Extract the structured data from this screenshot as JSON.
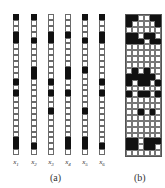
{
  "panel_a": {
    "caption": "(a)",
    "rows": 24,
    "columns": [
      {
        "label": "x",
        "subscript": "1",
        "left": 13,
        "on": [
          0,
          3,
          4,
          11,
          13,
          21,
          22
        ]
      },
      {
        "label": "x",
        "subscript": "2",
        "left": 31,
        "on": [
          0,
          4,
          9,
          10,
          22
        ]
      },
      {
        "label": "x",
        "subscript": "3",
        "left": 48,
        "on": [
          3,
          4,
          11,
          13,
          16
        ]
      },
      {
        "label": "x",
        "subscript": "4",
        "left": 65,
        "on": [
          3,
          9,
          10,
          13,
          21,
          22
        ]
      },
      {
        "label": "x",
        "subscript": "5",
        "left": 82,
        "on": [
          0,
          4,
          9,
          16,
          21,
          22
        ]
      },
      {
        "label": "x",
        "subscript": "6",
        "left": 99,
        "on": [
          0,
          3,
          4,
          11,
          13,
          22
        ]
      }
    ]
  },
  "panel_b": {
    "caption": "(b)",
    "cols": 6,
    "rows": 24,
    "on": [
      [
        0,
        0
      ],
      [
        0,
        1
      ],
      [
        0,
        4
      ],
      [
        0,
        5
      ],
      [
        1,
        0
      ],
      [
        1,
        5
      ],
      [
        3,
        0
      ],
      [
        3,
        1
      ],
      [
        3,
        3
      ],
      [
        3,
        4
      ],
      [
        4,
        0
      ],
      [
        4,
        1
      ],
      [
        4,
        2
      ],
      [
        4,
        4
      ],
      [
        4,
        5
      ],
      [
        9,
        1
      ],
      [
        9,
        3
      ],
      [
        10,
        0
      ],
      [
        10,
        1
      ],
      [
        10,
        2
      ],
      [
        10,
        3
      ],
      [
        10,
        4
      ],
      [
        11,
        0
      ],
      [
        11,
        2
      ],
      [
        11,
        3
      ],
      [
        11,
        5
      ],
      [
        13,
        0
      ],
      [
        13,
        2
      ],
      [
        13,
        3
      ],
      [
        13,
        5
      ],
      [
        16,
        2
      ],
      [
        16,
        4
      ],
      [
        21,
        0
      ],
      [
        21,
        1
      ],
      [
        21,
        3
      ],
      [
        21,
        4
      ],
      [
        21,
        5
      ],
      [
        22,
        0
      ],
      [
        22,
        1
      ],
      [
        22,
        3
      ],
      [
        22,
        4
      ]
    ]
  }
}
